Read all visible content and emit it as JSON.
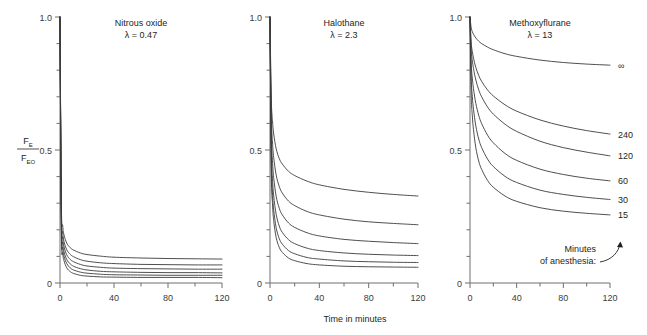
{
  "figure": {
    "y_axis_label_numerator": "F",
    "y_axis_label_numerator_sub": "E",
    "y_axis_label_denominator": "F",
    "y_axis_label_denominator_sub": "EO",
    "x_axis_title": "Time in minutes",
    "legend_line1": "Minutes",
    "legend_line2": "of anesthesia:",
    "y_ticklabels": [
      "1.0",
      "0.5",
      "0"
    ],
    "x_ticklabels": [
      "0",
      "40",
      "80",
      "120"
    ]
  },
  "chart_data": {
    "type": "line",
    "title": "",
    "xlabel": "Time in minutes",
    "ylabel": "FE/FEO",
    "xlim": [
      0,
      120
    ],
    "ylim": [
      0,
      1.0
    ],
    "grid": false,
    "legend": "right of third panel",
    "legend_title": "Minutes of anesthesia:",
    "panels": [
      {
        "name": "Nitrous oxide",
        "title": "Nitrous oxide",
        "lambda_label": "λ = 0.47",
        "lambda": 0.47,
        "x": [
          0,
          1,
          2,
          3,
          5,
          7.5,
          10,
          15,
          20,
          30,
          40,
          60,
          80,
          100,
          120
        ],
        "series": [
          {
            "name": "∞",
            "label": "",
            "values": [
              1.0,
              0.3,
              0.215,
              0.18,
              0.15,
              0.133,
              0.124,
              0.113,
              0.107,
              0.101,
              0.097,
              0.094,
              0.092,
              0.091,
              0.09
            ]
          },
          {
            "name": "240",
            "label": "",
            "values": [
              1.0,
              0.275,
              0.19,
              0.155,
              0.125,
              0.108,
              0.099,
              0.088,
              0.082,
              0.076,
              0.073,
              0.07,
              0.069,
              0.068,
              0.068
            ]
          },
          {
            "name": "120",
            "label": "",
            "values": [
              1.0,
              0.255,
              0.17,
              0.136,
              0.106,
              0.089,
              0.08,
              0.07,
              0.064,
              0.059,
              0.056,
              0.054,
              0.053,
              0.052,
              0.052
            ]
          },
          {
            "name": "60",
            "label": "",
            "values": [
              1.0,
              0.235,
              0.15,
              0.117,
              0.088,
              0.072,
              0.063,
              0.054,
              0.049,
              0.044,
              0.042,
              0.04,
              0.039,
              0.039,
              0.038
            ]
          },
          {
            "name": "30",
            "label": "",
            "values": [
              1.0,
              0.215,
              0.132,
              0.1,
              0.073,
              0.057,
              0.049,
              0.041,
              0.037,
              0.033,
              0.031,
              0.03,
              0.029,
              0.029,
              0.029
            ]
          },
          {
            "name": "15",
            "label": "",
            "values": [
              1.0,
              0.195,
              0.113,
              0.083,
              0.057,
              0.043,
              0.036,
              0.029,
              0.026,
              0.023,
              0.022,
              0.021,
              0.021,
              0.021,
              0.02
            ]
          }
        ]
      },
      {
        "name": "Halothane",
        "title": "Halothane",
        "lambda_label": "λ = 2.3",
        "lambda": 2.3,
        "x": [
          0,
          1,
          2,
          3,
          5,
          7.5,
          10,
          15,
          20,
          30,
          40,
          60,
          80,
          100,
          120
        ],
        "series": [
          {
            "name": "∞",
            "label": "",
            "values": [
              1.0,
              0.7,
              0.61,
              0.56,
              0.505,
              0.468,
              0.447,
              0.42,
              0.404,
              0.383,
              0.369,
              0.352,
              0.341,
              0.333,
              0.327
            ]
          },
          {
            "name": "240",
            "label": "",
            "values": [
              1.0,
              0.64,
              0.53,
              0.472,
              0.406,
              0.363,
              0.338,
              0.308,
              0.291,
              0.269,
              0.256,
              0.24,
              0.23,
              0.224,
              0.219
            ]
          },
          {
            "name": "120",
            "label": "",
            "values": [
              1.0,
              0.58,
              0.46,
              0.396,
              0.326,
              0.281,
              0.256,
              0.226,
              0.209,
              0.189,
              0.177,
              0.164,
              0.157,
              0.152,
              0.148
            ]
          },
          {
            "name": "60",
            "label": "",
            "values": [
              1.0,
              0.52,
              0.393,
              0.328,
              0.258,
              0.214,
              0.19,
              0.163,
              0.148,
              0.131,
              0.122,
              0.113,
              0.108,
              0.105,
              0.103
            ]
          },
          {
            "name": "30",
            "label": "",
            "values": [
              1.0,
              0.47,
              0.34,
              0.275,
              0.208,
              0.167,
              0.146,
              0.122,
              0.11,
              0.096,
              0.09,
              0.083,
              0.08,
              0.078,
              0.077
            ]
          },
          {
            "name": "15",
            "label": "",
            "values": [
              1.0,
              0.43,
              0.298,
              0.235,
              0.171,
              0.134,
              0.115,
              0.094,
              0.084,
              0.073,
              0.068,
              0.063,
              0.061,
              0.06,
              0.059
            ]
          }
        ]
      },
      {
        "name": "Methoxyflurane",
        "title": "Methoxyflurane",
        "lambda_label": "λ = 13",
        "lambda": 13,
        "x": [
          0,
          1,
          2,
          3,
          5,
          7.5,
          10,
          15,
          20,
          30,
          40,
          60,
          80,
          100,
          120
        ],
        "series": [
          {
            "name": "∞",
            "label": "∞",
            "values": [
              1.0,
              0.96,
              0.945,
              0.935,
              0.921,
              0.909,
              0.9,
              0.887,
              0.877,
              0.862,
              0.852,
              0.838,
              0.829,
              0.823,
              0.819
            ]
          },
          {
            "name": "240",
            "label": "240",
            "values": [
              1.0,
              0.905,
              0.87,
              0.845,
              0.81,
              0.78,
              0.758,
              0.726,
              0.703,
              0.67,
              0.646,
              0.613,
              0.59,
              0.573,
              0.56
            ]
          },
          {
            "name": "120",
            "label": "120",
            "values": [
              1.0,
              0.88,
              0.836,
              0.806,
              0.763,
              0.726,
              0.7,
              0.662,
              0.635,
              0.597,
              0.57,
              0.533,
              0.509,
              0.492,
              0.478
            ]
          },
          {
            "name": "60",
            "label": "60",
            "values": [
              1.0,
              0.83,
              0.77,
              0.73,
              0.675,
              0.63,
              0.599,
              0.556,
              0.527,
              0.487,
              0.461,
              0.428,
              0.408,
              0.394,
              0.384
            ]
          },
          {
            "name": "30",
            "label": "30",
            "values": [
              1.0,
              0.775,
              0.7,
              0.653,
              0.59,
              0.541,
              0.509,
              0.466,
              0.438,
              0.401,
              0.378,
              0.349,
              0.333,
              0.322,
              0.314
            ]
          },
          {
            "name": "15",
            "label": "15",
            "values": [
              1.0,
              0.715,
              0.628,
              0.576,
              0.508,
              0.458,
              0.427,
              0.386,
              0.36,
              0.327,
              0.307,
              0.283,
              0.27,
              0.262,
              0.256
            ]
          }
        ]
      }
    ]
  }
}
